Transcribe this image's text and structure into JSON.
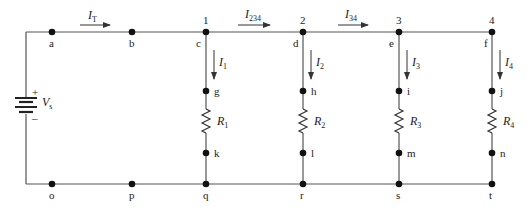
{
  "diagram": {
    "type": "parallel-circuit",
    "source": {
      "label": "V",
      "subscript": "s",
      "plus": "+",
      "minus": "–"
    },
    "top_nodes": [
      {
        "id": "a",
        "label": "a"
      },
      {
        "id": "b",
        "label": "b"
      },
      {
        "id": "c",
        "label": "c",
        "junction": "1"
      },
      {
        "id": "d",
        "label": "d",
        "junction": "2"
      },
      {
        "id": "e",
        "label": "e",
        "junction": "3"
      },
      {
        "id": "f",
        "label": "f",
        "junction": "4"
      }
    ],
    "bottom_nodes": [
      {
        "id": "o",
        "label": "o"
      },
      {
        "id": "p",
        "label": "p"
      },
      {
        "id": "q",
        "label": "q"
      },
      {
        "id": "r",
        "label": "r"
      },
      {
        "id": "s",
        "label": "s"
      },
      {
        "id": "t",
        "label": "t"
      }
    ],
    "branches": [
      {
        "upper": "g",
        "lower": "k",
        "resistor": "R",
        "resistor_sub": "1",
        "current": "I",
        "current_sub": "1"
      },
      {
        "upper": "h",
        "lower": "l",
        "resistor": "R",
        "resistor_sub": "2",
        "current": "I",
        "current_sub": "2"
      },
      {
        "upper": "i",
        "lower": "m",
        "resistor": "R",
        "resistor_sub": "3",
        "current": "I",
        "current_sub": "3"
      },
      {
        "upper": "j",
        "lower": "n",
        "resistor": "R",
        "resistor_sub": "4",
        "current": "I",
        "current_sub": "4"
      }
    ],
    "line_currents": [
      {
        "label": "I",
        "sub": "T"
      },
      {
        "label": "I",
        "sub": "234"
      },
      {
        "label": "I",
        "sub": "34"
      }
    ]
  }
}
